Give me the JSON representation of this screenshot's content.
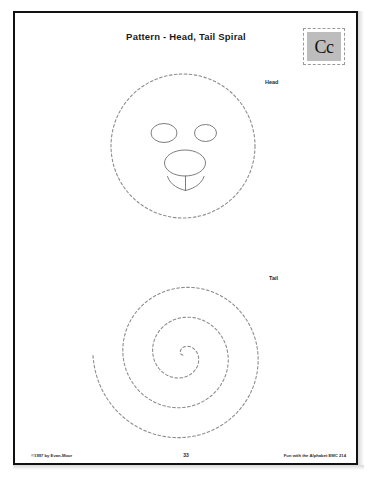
{
  "page": {
    "title": "Pattern - Head, Tail Spiral",
    "letter_tile": {
      "text": "Cc",
      "fill_color": "#bdbdbd",
      "border_style": "dashed"
    },
    "labels": {
      "head": "Head",
      "tail": "Tail"
    },
    "footer": {
      "copyright": "©1997 by Evan-Moor",
      "page_number": "33",
      "source": "Fun with the Alphabet EMC 214"
    },
    "colors": {
      "frame": "#111111",
      "dashed_line": "#8d8d8d",
      "face_line": "#6f6f6f",
      "paper": "#ffffff"
    },
    "shapes": {
      "head_circle": {
        "name": "head-cut-out-circle",
        "center_x": 183,
        "center_y": 146,
        "radius": 72,
        "stroke": "dashed"
      },
      "face": {
        "left_eye": {
          "cx": 164,
          "cy": 133,
          "rx": 13,
          "ry": 9
        },
        "right_eye": {
          "cx": 205,
          "cy": 133,
          "rx": 11,
          "ry": 8
        },
        "nose": {
          "cx": 185,
          "cy": 163,
          "rx": 20,
          "ry": 13
        },
        "mouth_left_arc": "curve from (168,177) sweeping down-left to (186,190)",
        "mouth_right_arc": "curve from (186,190) sweeping down-right to (206,177)",
        "mouth_stem": "vertical line (186,176) to (186,190)"
      },
      "tail_spiral": {
        "name": "tail-spiral",
        "center_x": 183,
        "center_y": 355,
        "turns": 3,
        "max_radius": 90,
        "stroke": "dashed"
      }
    }
  }
}
